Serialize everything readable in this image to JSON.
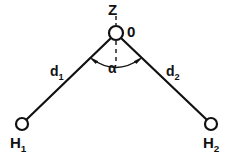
{
  "diagram": {
    "background_color": "#ffffff",
    "stroke_color": "#111111",
    "labels": {
      "axis_z": "Z",
      "center_atom": "0",
      "angle": "α",
      "bond_left_base": "d",
      "bond_left_sub": "1",
      "bond_right_base": "d",
      "bond_right_sub": "2",
      "atom_left_base": "H",
      "atom_left_sub": "1",
      "atom_right_base": "H",
      "atom_right_sub": "2"
    },
    "nodes": [
      {
        "name": "oxygen-atom",
        "label": "0",
        "x": 116,
        "y": 33,
        "r": 7
      },
      {
        "name": "hydrogen-atom-1",
        "label": "H1",
        "x": 22,
        "y": 124,
        "r": 6
      },
      {
        "name": "hydrogen-atom-2",
        "label": "H2",
        "x": 211,
        "y": 124,
        "r": 6
      }
    ],
    "bonds": [
      {
        "name": "bond-d1",
        "label": "d1",
        "from": "oxygen-atom",
        "to": "hydrogen-atom-1"
      },
      {
        "name": "bond-d2",
        "label": "d2",
        "from": "oxygen-atom",
        "to": "hydrogen-atom-2"
      }
    ],
    "axis": {
      "name": "z-axis",
      "label": "Z",
      "style": "dashed",
      "orientation": "vertical"
    },
    "angle_marker": {
      "name": "bond-angle-alpha",
      "label": "α",
      "arrows": "both-ends"
    }
  }
}
